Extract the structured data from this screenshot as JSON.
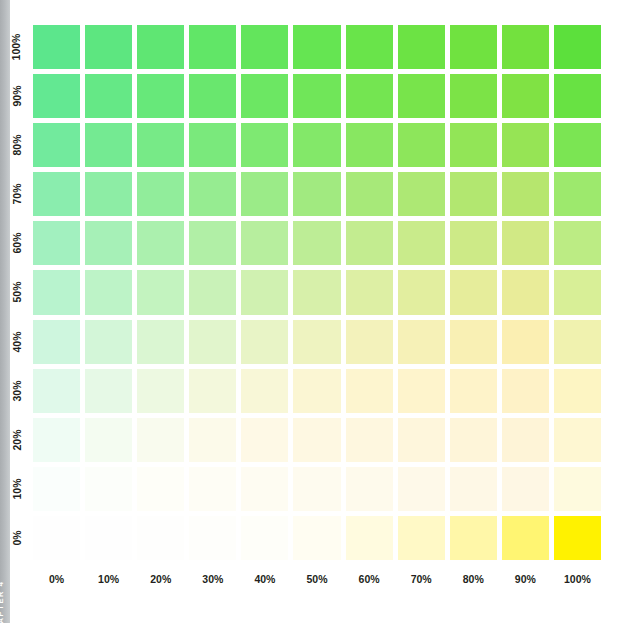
{
  "chapter": {
    "label": "CHAPTER 4"
  },
  "chart_data": {
    "type": "heatmap",
    "title": "",
    "xlabel": "",
    "ylabel": "",
    "grid": true,
    "legend": "none",
    "x_tick_labels": [
      "0%",
      "10%",
      "20%",
      "30%",
      "40%",
      "50%",
      "60%",
      "70%",
      "80%",
      "90%",
      "100%"
    ],
    "y_tick_labels": [
      "100%",
      "90%",
      "80%",
      "70%",
      "60%",
      "50%",
      "40%",
      "30%",
      "20%",
      "10%",
      "0%"
    ],
    "x_values": [
      0,
      10,
      20,
      30,
      40,
      50,
      60,
      70,
      80,
      90,
      100
    ],
    "y_values": [
      100,
      90,
      80,
      70,
      60,
      50,
      40,
      30,
      20,
      10,
      0
    ],
    "x_axis_ink": "yellow",
    "y_axis_ink": "green",
    "corner_colors": {
      "top_left": "#5CE68C",
      "top_right": "#5CE03C",
      "bottom_left": "#FEFEFE",
      "bottom_right": "#FFF200"
    },
    "rows": [
      {
        "y": 100,
        "label": "100%",
        "colors": [
          "#5CE68C",
          "#5DE680",
          "#5FE673",
          "#61E667",
          "#63E55C",
          "#65E552",
          "#69E44A",
          "#6CE344",
          "#70E240",
          "#73E13E",
          "#5CE03C"
        ]
      },
      {
        "y": 90,
        "label": "90%",
        "colors": [
          "#63E892",
          "#65E886",
          "#67E87A",
          "#69E76E",
          "#6CE763",
          "#70E659",
          "#74E551",
          "#78E44B",
          "#7CE347",
          "#80E244",
          "#68E243"
        ]
      },
      {
        "y": 80,
        "label": "80%",
        "colors": [
          "#72EA9D",
          "#74EA92",
          "#77EA87",
          "#7AE97C",
          "#7EE972",
          "#83E869",
          "#88E761",
          "#8DE65B",
          "#92E557",
          "#96E455",
          "#7BE553"
        ]
      },
      {
        "y": 70,
        "label": "70%",
        "colors": [
          "#8AEDAE",
          "#8DEDA5",
          "#91ED9B",
          "#96EC91",
          "#9BEB88",
          "#A1EA80",
          "#A7E979",
          "#ADE874",
          "#B2E770",
          "#B6E66E",
          "#9DE96D"
        ]
      },
      {
        "y": 60,
        "label": "60%",
        "colors": [
          "#A2F0BF",
          "#A6F0B7",
          "#ABF0AE",
          "#B1EFA6",
          "#B7EE9E",
          "#BDED96",
          "#C3EC90",
          "#C9EB8B",
          "#CDEA87",
          "#D1E985",
          "#BCEC84"
        ]
      },
      {
        "y": 50,
        "label": "50%",
        "colors": [
          "#B8F3CE",
          "#BDF3C7",
          "#C3F3BF",
          "#C9F2B8",
          "#D0F1B1",
          "#D7F0AA",
          "#DDEFA4",
          "#E2EE9F",
          "#E6ED9B",
          "#E9EC99",
          "#D8EF97"
        ]
      },
      {
        "y": 40,
        "label": "40%",
        "colors": [
          "#CEF6DE",
          "#D3F6D8",
          "#DAF6D2",
          "#E1F5CC",
          "#E8F4C6",
          "#EEF3C0",
          "#F3F2BB",
          "#F6F1B7",
          "#F9F0B4",
          "#FBEFB2",
          "#F0F2AF"
        ]
      },
      {
        "y": 30,
        "label": "30%",
        "colors": [
          "#E0F9EA",
          "#E6F9E6",
          "#EDF9E1",
          "#F3F8DC",
          "#F8F7D7",
          "#FBF6D3",
          "#FDF5CF",
          "#FEF4CC",
          "#FEF3C9",
          "#FEF2C7",
          "#FDF5C3"
        ]
      },
      {
        "y": 20,
        "label": "20%",
        "colors": [
          "#EFFCF4",
          "#F4FCF1",
          "#F9FBEE",
          "#FCFAEA",
          "#FEF9E6",
          "#FEF8E2",
          "#FEF7DF",
          "#FEF6DC",
          "#FEF5D9",
          "#FEF4D7",
          "#FEF7D2"
        ]
      },
      {
        "y": 10,
        "label": "10%",
        "colors": [
          "#FAFEFC",
          "#FCFEFA",
          "#FEFEF8",
          "#FEFDF5",
          "#FEFCF2",
          "#FEFBEF",
          "#FEFAEC",
          "#FEF9E9",
          "#FEF8E6",
          "#FEF7E4",
          "#FEFADE"
        ]
      },
      {
        "y": 0,
        "label": "0%",
        "colors": [
          "#FEFEFE",
          "#FEFEFE",
          "#FEFEFD",
          "#FEFEFB",
          "#FEFEF9",
          "#FFFDF2",
          "#FFFBDF",
          "#FFF9C6",
          "#FFF7A8",
          "#FFF572",
          "#FFF200"
        ]
      }
    ]
  }
}
